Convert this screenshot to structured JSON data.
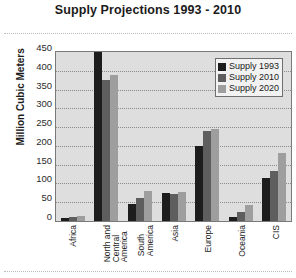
{
  "chart_data": {
    "type": "bar",
    "title": "Supply Projections 1993 - 2010",
    "xlabel": "",
    "ylabel": "Million Cubic Meters",
    "ylim": [
      0,
      450
    ],
    "ytick_step": 50,
    "yticks": [
      450,
      400,
      350,
      300,
      250,
      200,
      150,
      100,
      50,
      0
    ],
    "grid": true,
    "legend_position": "top-right",
    "categories": [
      "Africa",
      "North and\nCentral\nAmerica",
      "South\nAmerica",
      "Asia",
      "Europe",
      "Oceania",
      "CIS"
    ],
    "series": [
      {
        "name": "Supply 1993",
        "color": "#1d1d1d",
        "values": [
          8,
          450,
          45,
          75,
          200,
          12,
          115
        ]
      },
      {
        "name": "Supply 2010",
        "color": "#5e5e5e",
        "values": [
          10,
          375,
          60,
          72,
          240,
          25,
          132
        ]
      },
      {
        "name": "Supply 2020",
        "color": "#9e9e9e",
        "values": [
          14,
          390,
          80,
          78,
          245,
          42,
          182
        ]
      }
    ]
  },
  "colors": {
    "plot_background": "#dedede",
    "plot_border": "#7a7a7a",
    "gridline": "#8b8b8b",
    "page_background": "#ffffff",
    "text": "#1b1b1b",
    "legend_background": "#f2f2f2"
  }
}
